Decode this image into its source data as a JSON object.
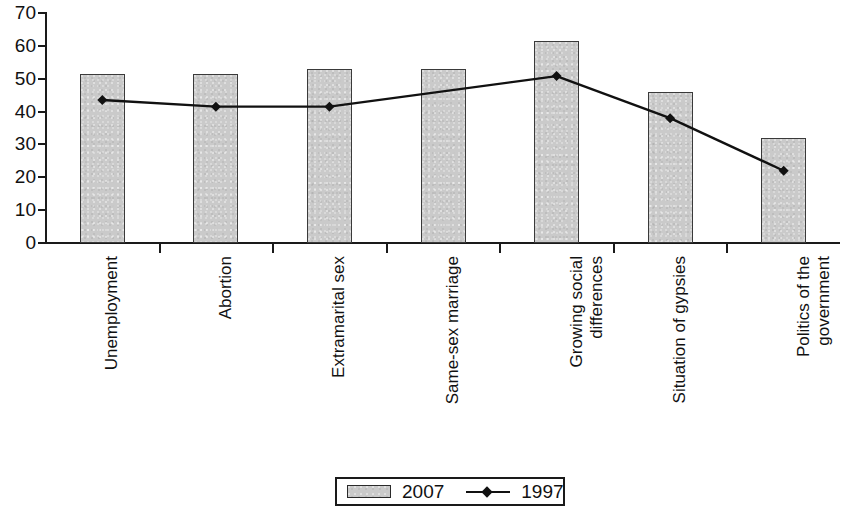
{
  "chart_data": {
    "type": "bar",
    "title": "",
    "subtitle": "",
    "xlabel": "",
    "ylabel": "",
    "ylim": [
      0,
      70
    ],
    "ytick_step": 10,
    "yticks": [
      0,
      10,
      20,
      30,
      40,
      50,
      60,
      70
    ],
    "grid": false,
    "legend_position": "bottom-center",
    "categories": [
      "Unemployment",
      "Abortion",
      "Extramarital sex",
      "Same-sex marriage",
      "Growing social\ndifferences",
      "Situation of gypsies",
      "Politics of the\ngovernment"
    ],
    "series": [
      {
        "name": "2007",
        "type": "bar",
        "color": "#cacaca",
        "values": [
          51.5,
          51.5,
          53.0,
          53.0,
          61.5,
          46.0,
          32.0
        ]
      },
      {
        "name": "1997",
        "type": "line",
        "color": "#111111",
        "marker": "diamond",
        "values": [
          43.5,
          41.5,
          41.5,
          null,
          50.8,
          38.0,
          22.0
        ]
      }
    ]
  },
  "legend": {
    "entries": [
      {
        "label": "2007",
        "marker": "bar-swatch"
      },
      {
        "label": "1997",
        "marker": "line-diamond"
      }
    ]
  },
  "axis": {
    "y_tick_labels": [
      "70",
      "60",
      "50",
      "40",
      "30",
      "20",
      "10",
      "0"
    ]
  }
}
